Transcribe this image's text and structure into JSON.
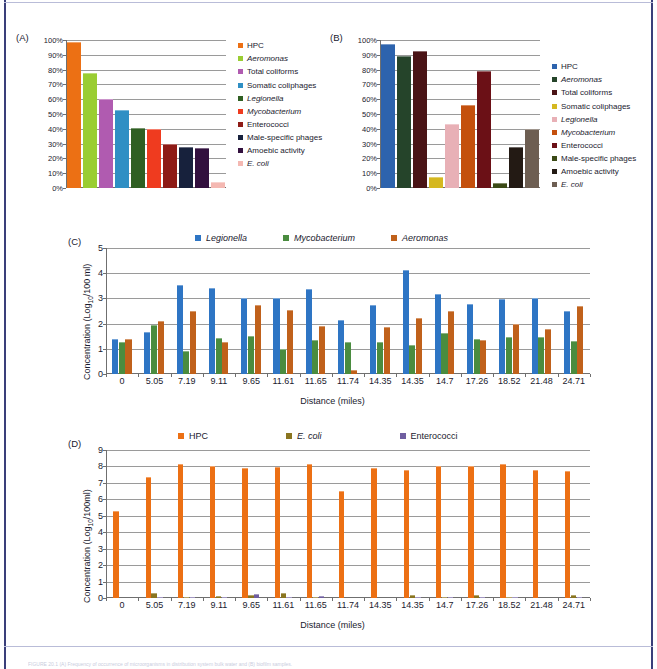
{
  "figure": {
    "background": "#ffffff",
    "border_color": "#3a3f7a",
    "caption": "FIGURE 20.1 (A) Frequency of occurrence of microorganisms in distribution system bulk water and (B) biofilm samples."
  },
  "panels": {
    "A": {
      "label": "(A)",
      "chart_data": {
        "type": "bar",
        "title": "",
        "xlabel": "",
        "ylabel": "",
        "ylim": [
          0,
          100
        ],
        "ytick_labels": [
          "0%",
          "10%",
          "20%",
          "30%",
          "40%",
          "50%",
          "60%",
          "70%",
          "80%",
          "90%",
          "100%"
        ],
        "ytick_values": [
          0,
          10,
          20,
          30,
          40,
          50,
          60,
          70,
          80,
          90,
          100
        ],
        "grid": true,
        "legend_position": "right",
        "categories": [
          "HPC",
          "Aeromonas",
          "Total coliforms",
          "Somatic coliphages",
          "Legionella",
          "Mycobacterium",
          "Enterococci",
          "Male-specific phages",
          "Amoebic activity",
          "E. coli"
        ],
        "values": [
          98.5,
          78.0,
          60.0,
          52.5,
          40.5,
          39.8,
          29.5,
          28.0,
          27.0,
          4.0
        ],
        "colors": [
          "#ec7014",
          "#9acd32",
          "#b05bb0",
          "#2f8fc4",
          "#2f5f22",
          "#ef3b1f",
          "#8e1b16",
          "#17213c",
          "#32103e",
          "#f4b8b2"
        ],
        "italic_categories": [
          "Aeromonas",
          "Legionella",
          "Mycobacterium",
          "E. coli"
        ]
      }
    },
    "B": {
      "label": "(B)",
      "chart_data": {
        "type": "bar",
        "title": "",
        "xlabel": "",
        "ylabel": "",
        "ylim": [
          0,
          100
        ],
        "ytick_labels": [
          "0%",
          "10%",
          "20%",
          "30%",
          "40%",
          "50%",
          "60%",
          "70%",
          "80%",
          "90%",
          "100%"
        ],
        "ytick_values": [
          0,
          10,
          20,
          30,
          40,
          50,
          60,
          70,
          80,
          90,
          100
        ],
        "grid": true,
        "legend_position": "right",
        "categories": [
          "HPC",
          "Aeromonas",
          "Total coliforms",
          "Somatic coliphages",
          "Legionella",
          "Mycobacterium",
          "Enterococci",
          "Male-specific phages",
          "Amoebic activity",
          "E. coli"
        ],
        "values": [
          97.5,
          89.5,
          92.5,
          7.5,
          43.5,
          56.0,
          79.0,
          3.5,
          27.5,
          40.0
        ],
        "colors": [
          "#2d63ad",
          "#25442a",
          "#4a1416",
          "#d5b820",
          "#e8b0b6",
          "#c4500d",
          "#6b1016",
          "#3b4a16",
          "#231a14",
          "#6d5e52"
        ],
        "italic_categories": [
          "Aeromonas",
          "Legionella",
          "Mycobacterium",
          "E. coli"
        ]
      }
    },
    "C": {
      "label": "(C)",
      "chart_data": {
        "type": "bar",
        "title": "",
        "xlabel": "Distance (miles)",
        "ylabel": "Concentration (Log10/100 ml)",
        "ylim": [
          0,
          5
        ],
        "ytick_labels": [
          "0",
          "1",
          "2",
          "3",
          "4",
          "5"
        ],
        "ytick_values": [
          0,
          1,
          2,
          3,
          4,
          5
        ],
        "grid": true,
        "legend_position": "top",
        "categories": [
          "0",
          "5.05",
          "7.19",
          "9.11",
          "9.65",
          "11.61",
          "11.65",
          "11.74",
          "14.35",
          "14.35",
          "14.7",
          "17.26",
          "18.52",
          "21.48",
          "24.71"
        ],
        "series": [
          {
            "name": "Legionella",
            "color": "#2e75c4",
            "italic": true,
            "values": [
              1.4,
              1.66,
              3.52,
              3.4,
              3.0,
              3.0,
              3.36,
              2.14,
              2.72,
              4.13,
              3.17,
              2.79,
              2.97,
              3.0,
              2.52
            ]
          },
          {
            "name": "Mycobacterium",
            "color": "#4a8c3f",
            "italic": true,
            "values": [
              1.28,
              1.96,
              0.93,
              1.43,
              1.49,
              1.0,
              1.34,
              1.26,
              1.27,
              1.14,
              1.63,
              1.37,
              1.45,
              1.45,
              1.3
            ]
          },
          {
            "name": "Aeromonas",
            "color": "#c0611b",
            "italic": true,
            "values": [
              1.4,
              2.11,
              2.51,
              1.27,
              2.75,
              2.55,
              1.9,
              0.17,
              1.88,
              2.21,
              2.51,
              1.34,
              1.97,
              1.78,
              2.69
            ]
          }
        ]
      }
    },
    "D": {
      "label": "(D)",
      "chart_data": {
        "type": "bar",
        "title": "",
        "xlabel": "Distance (miles)",
        "ylabel": "Concentration (Log10/100ml)",
        "ylim": [
          0,
          9
        ],
        "ytick_labels": [
          "0",
          "1",
          "2",
          "3",
          "4",
          "5",
          "6",
          "7",
          "8",
          "9"
        ],
        "ytick_values": [
          0,
          1,
          2,
          3,
          4,
          5,
          6,
          7,
          8,
          9
        ],
        "grid": true,
        "legend_position": "top",
        "categories": [
          "0",
          "5.05",
          "7.19",
          "9.11",
          "9.65",
          "11.61",
          "11.65",
          "11.74",
          "14.35",
          "14.35",
          "14.7",
          "17.26",
          "18.52",
          "21.48",
          "24.71"
        ],
        "series": [
          {
            "name": "HPC",
            "color": "#ec7014",
            "italic": false,
            "values": [
              5.3,
              7.36,
              8.12,
              8.0,
              7.88,
              7.96,
              8.12,
              6.49,
              7.93,
              7.78,
              8.0,
              8.05,
              8.15,
              7.8,
              7.72
            ]
          },
          {
            "name": "E. coli",
            "color": "#8a7520",
            "italic": true,
            "values": [
              0.0,
              0.33,
              0.03,
              0.13,
              0.18,
              0.28,
              0.07,
              0.0,
              0.0,
              0.18,
              0.04,
              0.17,
              0.04,
              0.0,
              0.17
            ]
          },
          {
            "name": "Enterococci",
            "color": "#6f5ea0",
            "italic": false,
            "values": [
              0.0,
              0.04,
              0.02,
              0.03,
              0.22,
              0.02,
              0.12,
              0.0,
              0.0,
              0.03,
              0.05,
              0.03,
              0.05,
              0.0,
              0.02
            ]
          }
        ]
      }
    }
  },
  "axis_labels": {
    "distance": "Distance (miles)",
    "conc_c": "Concentration (Log",
    "conc_c_sub": "10",
    "conc_c_tail": "/100 ml)",
    "conc_d": "Concentration (Log",
    "conc_d_sub": "10",
    "conc_d_tail": "/100ml)"
  }
}
